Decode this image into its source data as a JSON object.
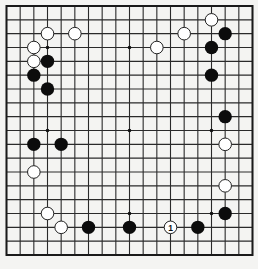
{
  "board": {
    "size": 19,
    "background": "#f4f4f2",
    "line_color": "#2a2a2a",
    "star_points": [
      [
        3,
        3
      ],
      [
        9,
        3
      ],
      [
        15,
        3
      ],
      [
        3,
        9
      ],
      [
        9,
        9
      ],
      [
        15,
        9
      ],
      [
        3,
        15
      ],
      [
        9,
        15
      ],
      [
        15,
        15
      ]
    ],
    "stones": [
      {
        "color": "white",
        "col": 3,
        "row": 2
      },
      {
        "color": "white",
        "col": 5,
        "row": 2
      },
      {
        "color": "white",
        "col": 2,
        "row": 3
      },
      {
        "color": "white",
        "col": 2,
        "row": 4
      },
      {
        "color": "black",
        "col": 3,
        "row": 4
      },
      {
        "color": "black",
        "col": 2,
        "row": 5
      },
      {
        "color": "black",
        "col": 3,
        "row": 6
      },
      {
        "color": "white",
        "col": 15,
        "row": 1
      },
      {
        "color": "white",
        "col": 13,
        "row": 2
      },
      {
        "color": "white",
        "col": 11,
        "row": 3
      },
      {
        "color": "black",
        "col": 16,
        "row": 2
      },
      {
        "color": "black",
        "col": 15,
        "row": 3
      },
      {
        "color": "black",
        "col": 15,
        "row": 5
      },
      {
        "color": "black",
        "col": 16,
        "row": 8
      },
      {
        "color": "white",
        "col": 16,
        "row": 10
      },
      {
        "color": "white",
        "col": 16,
        "row": 13
      },
      {
        "color": "black",
        "col": 16,
        "row": 15
      },
      {
        "color": "black",
        "col": 2,
        "row": 10
      },
      {
        "color": "black",
        "col": 4,
        "row": 10
      },
      {
        "color": "white",
        "col": 2,
        "row": 12
      },
      {
        "color": "white",
        "col": 3,
        "row": 15
      },
      {
        "color": "white",
        "col": 4,
        "row": 16
      },
      {
        "color": "black",
        "col": 6,
        "row": 16
      },
      {
        "color": "black",
        "col": 9,
        "row": 16
      },
      {
        "color": "white",
        "col": 12,
        "row": 16,
        "label": "1"
      },
      {
        "color": "black",
        "col": 14,
        "row": 16
      }
    ]
  }
}
